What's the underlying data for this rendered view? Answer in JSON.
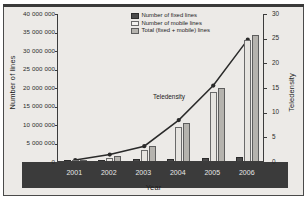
{
  "chart_data": {
    "type": "bar",
    "title": "",
    "xlabel": "Year",
    "ylabel": "Number of lines",
    "y2label": "Teledensity",
    "categories": [
      "2001",
      "2002",
      "2003",
      "2004",
      "2005",
      "2006"
    ],
    "ylim": [
      0,
      40000000
    ],
    "yticks": [
      0,
      5000000,
      10000000,
      15000000,
      20000000,
      25000000,
      30000000,
      35000000,
      40000000
    ],
    "ytick_labels": [
      "0",
      "5 000 000",
      "10 000 000",
      "15 000 000",
      "20 000 000",
      "25 000 000",
      "30 000 000",
      "35 000 000",
      "40 000 000"
    ],
    "y2lim": [
      0,
      30
    ],
    "y2ticks": [
      0,
      5,
      10,
      15,
      20,
      25,
      30
    ],
    "y2tick_labels": [
      "0",
      "5",
      "10",
      "15",
      "20",
      "25",
      "30"
    ],
    "grid": false,
    "legend_position": "top-center",
    "series": [
      {
        "name": "Number of fixed lines",
        "kind": "bar",
        "axis": "left",
        "color": "#4a4a4a",
        "values": [
          300000,
          400000,
          700000,
          900000,
          1100000,
          1300000
        ]
      },
      {
        "name": "Number of mobile lines",
        "kind": "bar",
        "axis": "left",
        "color": "#e6e4e0",
        "values": [
          200000,
          1200000,
          3200000,
          9500000,
          19000000,
          33000000
        ]
      },
      {
        "name": "Total (fixed + mobile) lines",
        "kind": "bar",
        "axis": "left",
        "color": "#b5b3ae",
        "values": [
          500000,
          1700000,
          4200000,
          10500000,
          20000000,
          34300000
        ]
      },
      {
        "name": "Teledensity",
        "kind": "line",
        "axis": "right",
        "color": "#2a2a2a",
        "values": [
          0.4,
          1.5,
          3.2,
          8.5,
          15.5,
          24.8
        ]
      }
    ],
    "annotations": [
      {
        "text": "Teledensity",
        "x": 153,
        "y": 93
      }
    ]
  },
  "legend": {
    "items": [
      {
        "label": "Number of fixed lines",
        "swatch": "fixed"
      },
      {
        "label": "Number of mobile lines",
        "swatch": "mobile"
      },
      {
        "label": "Total (fixed + mobile) lines",
        "swatch": "total"
      }
    ]
  }
}
